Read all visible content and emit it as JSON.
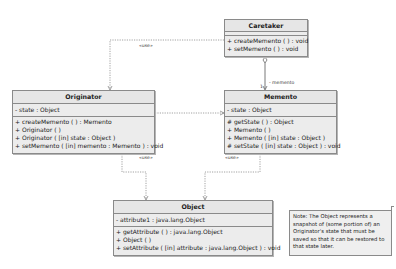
{
  "diagram": {
    "type": "uml-class-diagram",
    "classes": {
      "caretaker": {
        "name": "Caretaker",
        "attributes": [],
        "operations": [
          "+ createMemento ( ) : void",
          "+ setMemento ( ) : void"
        ]
      },
      "originator": {
        "name": "Originator",
        "attributes": [
          "- state : Object"
        ],
        "operations": [
          "+ createMemento ( ) : Memento",
          "+ Originator ( )",
          "+ Originator ( [in] state : Object )",
          "+ setMemento ( [in] memento : Memento ) : void"
        ]
      },
      "memento": {
        "name": "Memento",
        "attributes": [
          "- state : Object"
        ],
        "operations": [
          "# getState ( ) : Object",
          "+ Memento ( )",
          "+ Memento ( [in] state : Object )",
          "# setState ( [in] state : Object ) : void"
        ]
      },
      "object": {
        "name": "Object",
        "attributes": [
          "- attribute1 : java.lang.Object"
        ],
        "operations": [
          "+ getAttribute ( ) : java.lang.Object",
          "+ Object ( )",
          "+ setAttribute ( [in] attribute : java.lang.Object ) : void"
        ]
      }
    },
    "relationships": {
      "caretaker_originator": {
        "kind": "dependency",
        "from": "Caretaker",
        "to": "Originator",
        "stereotype": "«use»"
      },
      "caretaker_memento": {
        "kind": "aggregation",
        "from": "Caretaker",
        "to": "Memento",
        "multiplicity": "1",
        "role": "- memento"
      },
      "originator_memento": {
        "kind": "dependency",
        "from": "Originator",
        "to": "Memento"
      },
      "originator_object": {
        "kind": "dependency",
        "from": "Originator",
        "to": "Object",
        "stereotype": "«use»"
      },
      "memento_object": {
        "kind": "dependency",
        "from": "Memento",
        "to": "Object",
        "stereotype": "«use»"
      }
    },
    "note": {
      "text": "Note: The Object represents a snapshot of (some portion of) an Originator's state that must be saved so that it can be restored to that state later.",
      "lines": [
        "Note: The Object represents a",
        "snapshot of (some portion of) an",
        "Originator's state that must be",
        "saved so that it can be restored to",
        "that state later."
      ]
    }
  }
}
